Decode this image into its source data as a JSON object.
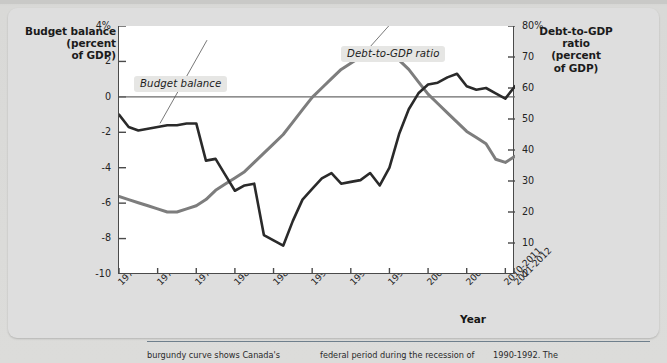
{
  "figure": {
    "x_axis_label": "Year",
    "left_axis_title_lines": [
      "Budget balance",
      "(percent",
      "of GDP)"
    ],
    "right_axis_title_lines": [
      "Debt-to-GDP",
      "ratio",
      "(percent",
      "of GDP)"
    ],
    "callouts": {
      "budget": "Budget balance",
      "debt": "Debt-to-GDP ratio"
    },
    "colors": {
      "budget_line": "#2a2a2a",
      "debt_line": "#7d7d7d",
      "zero_line": "#6a6a6a",
      "frame": "#4a4a4a",
      "plot_background": "#ffffff",
      "figure_background": "#dedede",
      "page_background": "#d8d8d6"
    },
    "caption": "burgundy curve shows Canada's federal period during the recession of 1990-1992. The"
  },
  "chart_data": {
    "type": "line",
    "title": "",
    "xlabel": "Year",
    "ylabel": "Budget balance (percent of GDP)",
    "y2label": "Debt-to-GDP ratio (percent of GDP)",
    "grid": false,
    "legend": "inline-callouts",
    "ylim": [
      -10,
      4
    ],
    "y2lim": [
      0,
      80
    ],
    "yticks": [
      "4%",
      "2",
      "0",
      "-2",
      "-4",
      "-6",
      "-8",
      "-10"
    ],
    "ytick_values": [
      4,
      2,
      0,
      -2,
      -4,
      -6,
      -8,
      -10
    ],
    "y2ticks": [
      "80%",
      "70",
      "60",
      "50",
      "40",
      "30",
      "20",
      "10",
      "0"
    ],
    "y2tick_values": [
      80,
      70,
      60,
      50,
      40,
      30,
      20,
      10,
      0
    ],
    "xtick_labels": [
      "1970-1971",
      "1974-1975",
      "1978-1979",
      "1982-1983",
      "1986-1987",
      "1990-1991",
      "1994-1995",
      "1998-1999",
      "2002-2003",
      "2006-2007",
      "2010-2011",
      "2011-2012"
    ],
    "xtick_positions": [
      0,
      4,
      8,
      12,
      16,
      20,
      24,
      28,
      32,
      36,
      40,
      41
    ],
    "x_index_range": [
      0,
      41
    ],
    "series": [
      {
        "name": "Budget balance",
        "axis": "left",
        "unit": "percent of GDP",
        "color": "#2a2a2a",
        "x": [
          0,
          1,
          2,
          3,
          4,
          5,
          6,
          7,
          8,
          9,
          10,
          11,
          12,
          13,
          14,
          15,
          16,
          17,
          18,
          19,
          20,
          21,
          22,
          23,
          24,
          25,
          26,
          27,
          28,
          29,
          30,
          31,
          32,
          33,
          34,
          35,
          36,
          37,
          38,
          39,
          40,
          41
        ],
        "values": [
          -1.0,
          -1.7,
          -1.9,
          -1.8,
          -1.7,
          -1.6,
          -1.6,
          -1.5,
          -1.5,
          -3.6,
          -3.5,
          -4.4,
          -5.3,
          -5.0,
          -4.9,
          -7.8,
          -8.1,
          -8.4,
          -7.0,
          -5.8,
          -5.2,
          -4.6,
          -4.3,
          -4.9,
          -4.8,
          -4.7,
          -4.3,
          -5.0,
          -4.0,
          -2.1,
          -0.7,
          0.2,
          0.7,
          0.8,
          1.1,
          1.3,
          0.6,
          0.4,
          0.5,
          0.2,
          -0.1,
          0.6
        ]
      },
      {
        "name": "Debt-to-GDP ratio",
        "axis": "right",
        "unit": "percent of GDP",
        "color": "#7d7d7d",
        "x": [
          0,
          1,
          2,
          3,
          4,
          5,
          6,
          7,
          8,
          9,
          10,
          11,
          12,
          13,
          14,
          15,
          16,
          17,
          18,
          19,
          20,
          21,
          22,
          23,
          24,
          25,
          26,
          27,
          28,
          29,
          30,
          31,
          32,
          33,
          34,
          35,
          36,
          37,
          38,
          39,
          40,
          41
        ],
        "values": [
          25,
          24,
          23,
          22,
          21,
          20,
          20,
          21,
          22,
          24,
          27,
          29,
          31,
          33,
          36,
          39,
          42,
          45,
          49,
          53,
          57,
          60,
          63,
          66,
          68,
          70,
          71,
          72,
          71,
          69,
          66,
          62,
          58,
          55,
          52,
          49,
          46,
          44,
          42,
          37,
          36,
          38
        ]
      }
    ],
    "notes": [
      "Left axis (Budget balance) runs 4% at top to -10 at bottom.",
      "Right axis (Debt-to-GDP ratio) runs 80% at top to 0 at bottom.",
      "Zero line on the left axis coincides with about 57% on the right axis."
    ]
  }
}
